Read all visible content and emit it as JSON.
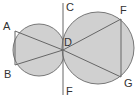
{
  "diagram": {
    "labels": {
      "A": "A",
      "B": "B",
      "C": "C",
      "D": "D",
      "F_top": "F",
      "F_bottom": "F",
      "G": "G"
    },
    "colors": {
      "fill": "#cfcfcf",
      "stroke": "#666666"
    },
    "circles": [
      {
        "name": "left",
        "cx": 39,
        "cy": 50,
        "r": 26
      },
      {
        "name": "right",
        "cx": 98,
        "cy": 48,
        "r": 36
      }
    ],
    "tangent_line": {
      "x": 63,
      "y1": 3,
      "y2": 95
    }
  }
}
